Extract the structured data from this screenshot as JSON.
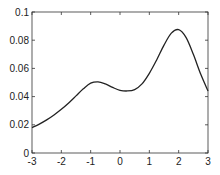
{
  "chart_data": {
    "type": "line",
    "title": "",
    "xlabel": "",
    "ylabel": "",
    "xlim": [
      -3,
      3
    ],
    "ylim": [
      0,
      0.1
    ],
    "grid": false,
    "legend": null,
    "x_ticks": [
      -3,
      -2,
      -1,
      0,
      1,
      2,
      3
    ],
    "x_tick_labels": [
      "-3",
      "-2",
      "-1",
      "0",
      "1",
      "2",
      "3"
    ],
    "y_ticks": [
      0,
      0.02,
      0.04,
      0.06,
      0.08,
      0.1
    ],
    "y_tick_labels": [
      "0",
      "0.02",
      "0.04",
      "0.06",
      "0.08",
      "0.1"
    ],
    "series": [
      {
        "name": "density",
        "color": "#222222",
        "x": [
          -3,
          -2.75,
          -2.5,
          -2.25,
          -2,
          -1.75,
          -1.5,
          -1.25,
          -1,
          -0.75,
          -0.5,
          -0.25,
          0,
          0.25,
          0.5,
          0.75,
          1,
          1.25,
          1.5,
          1.75,
          2,
          2.25,
          2.5,
          2.75,
          3
        ],
        "values": [
          0.018,
          0.0205,
          0.0235,
          0.027,
          0.031,
          0.0355,
          0.0405,
          0.0455,
          0.0495,
          0.0505,
          0.049,
          0.0465,
          0.0445,
          0.044,
          0.045,
          0.049,
          0.0565,
          0.066,
          0.0765,
          0.085,
          0.0875,
          0.082,
          0.07,
          0.056,
          0.044
        ]
      }
    ]
  }
}
